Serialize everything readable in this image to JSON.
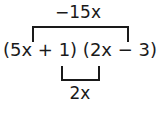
{
  "diagram": {
    "expression": "(5x + 1) (2x − 3)",
    "outer_product_label": "−15x",
    "inner_product_label": "2x",
    "outer_bracket": {
      "from_term": "5x",
      "to_term": "−3",
      "position": "top"
    },
    "inner_bracket": {
      "from_term": "1",
      "to_term": "2x",
      "position": "bottom"
    },
    "line_color": "#1a1a1a"
  }
}
